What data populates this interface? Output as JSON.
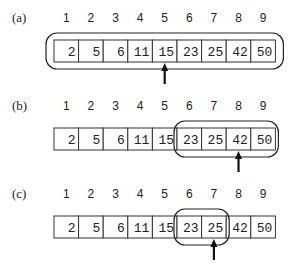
{
  "array": [
    2,
    5,
    6,
    11,
    15,
    23,
    25,
    42,
    50
  ],
  "indices": [
    "1",
    "2",
    "3",
    "4",
    "5",
    "6",
    "7",
    "8",
    "9"
  ],
  "panels": [
    {
      "label": "(a)",
      "range_start": 1,
      "range_end": 9,
      "pointer": 5
    },
    {
      "label": "(b)",
      "range_start": 6,
      "range_end": 9,
      "pointer": 8
    },
    {
      "label": "(c)",
      "range_start": 6,
      "range_end": 7,
      "pointer": 7
    }
  ]
}
